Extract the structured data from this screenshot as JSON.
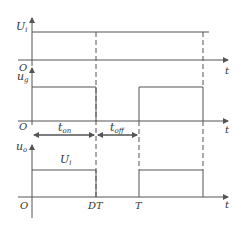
{
  "diagram": {
    "type": "timing-diagram",
    "stroke_color": "#555555",
    "plots": [
      {
        "y_label": "U",
        "y_label_sub": "i",
        "x_label": "t",
        "origin": "O"
      },
      {
        "y_label": "u",
        "y_label_sub": "g",
        "x_label": "t",
        "origin": "O"
      },
      {
        "y_label": "u",
        "y_label_sub": "o",
        "x_label": "t",
        "origin": "O",
        "level_label": "U",
        "level_label_sub": "i"
      }
    ],
    "intervals": {
      "on": {
        "main": "t",
        "sub": "on"
      },
      "off": {
        "main": "t",
        "sub": "off"
      }
    },
    "x_ticks": [
      "DT",
      "T"
    ]
  }
}
